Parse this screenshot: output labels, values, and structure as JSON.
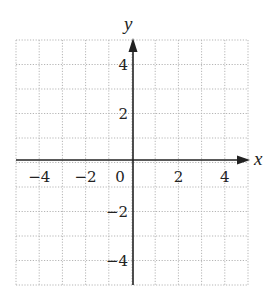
{
  "chart_data": {
    "type": "scatter",
    "title": "",
    "xlabel": "x",
    "ylabel": "y",
    "xlim": [
      -5,
      5
    ],
    "ylim": [
      -5,
      5
    ],
    "grid": true,
    "grid_style": "dotted",
    "grid_step": 1,
    "x_ticks": [
      -4,
      -2,
      0,
      2,
      4
    ],
    "y_ticks": [
      -4,
      -2,
      2,
      4
    ],
    "x_tick_labels": [
      "−4",
      "−2",
      "0",
      "2",
      "4"
    ],
    "y_tick_labels": [
      "−4",
      "−2",
      "2",
      "4"
    ],
    "series": [],
    "colors": {
      "axis": "#222222",
      "grid": "#b5b5b5",
      "background": "#ffffff"
    }
  },
  "labels": {
    "x_axis": "x",
    "y_axis": "y"
  }
}
